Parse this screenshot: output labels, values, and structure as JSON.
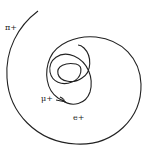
{
  "diagram": {
    "type": "particle-track-diagram",
    "labels": {
      "pion": "π+",
      "muon": "μ+",
      "electron": "e+"
    },
    "colors": {
      "track": "#222222",
      "background": "#ffffff"
    }
  }
}
